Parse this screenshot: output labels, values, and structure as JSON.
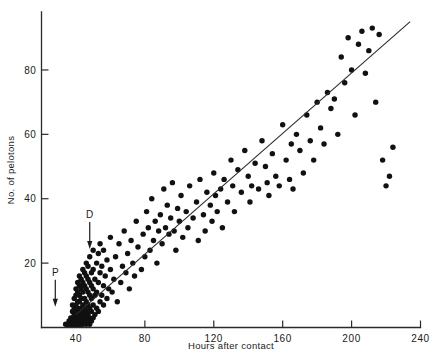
{
  "chart_data": {
    "type": "scatter",
    "title": "",
    "subtitle": "",
    "xlabel": "Hours after contact",
    "ylabel": "No. of pelotons",
    "xlim": [
      20,
      240
    ],
    "ylim": [
      0,
      98
    ],
    "grid": false,
    "legend": null,
    "x_ticks": [
      40,
      80,
      120,
      160,
      200,
      240
    ],
    "y_ticks": [
      20,
      40,
      60,
      80
    ],
    "x_tick_labels": [
      "40",
      "80",
      "120",
      "160",
      "200",
      "240"
    ],
    "y_tick_labels": [
      "20",
      "40",
      "60",
      "80"
    ],
    "annotations": [
      {
        "label": "P",
        "x": 28,
        "y": 12,
        "arrow": "down",
        "description": "arrow marking P event on time axis"
      },
      {
        "label": "D",
        "x": 48,
        "y": 30,
        "arrow": "down",
        "description": "arrow marking D event on time axis"
      }
    ],
    "series": [
      {
        "name": "pelotons",
        "marker": "filled-circle",
        "marker_color": "#111111",
        "marker_size": 4.2,
        "points": [
          [
            34,
            1
          ],
          [
            35,
            1
          ],
          [
            36,
            1
          ],
          [
            36,
            2
          ],
          [
            37,
            1
          ],
          [
            37,
            2
          ],
          [
            37,
            3
          ],
          [
            38,
            1
          ],
          [
            38,
            2
          ],
          [
            38,
            3
          ],
          [
            38,
            5
          ],
          [
            38,
            7
          ],
          [
            39,
            1
          ],
          [
            39,
            2
          ],
          [
            39,
            4
          ],
          [
            39,
            6
          ],
          [
            39,
            9
          ],
          [
            40,
            1
          ],
          [
            40,
            2
          ],
          [
            40,
            3
          ],
          [
            40,
            5
          ],
          [
            40,
            7
          ],
          [
            40,
            10
          ],
          [
            40,
            12
          ],
          [
            41,
            1
          ],
          [
            41,
            2
          ],
          [
            41,
            4
          ],
          [
            41,
            6
          ],
          [
            41,
            8
          ],
          [
            41,
            11
          ],
          [
            41,
            14
          ],
          [
            42,
            1
          ],
          [
            42,
            2
          ],
          [
            42,
            3
          ],
          [
            42,
            5
          ],
          [
            42,
            8
          ],
          [
            42,
            10
          ],
          [
            42,
            13
          ],
          [
            42,
            16
          ],
          [
            43,
            1
          ],
          [
            43,
            2
          ],
          [
            43,
            4
          ],
          [
            43,
            6
          ],
          [
            43,
            9
          ],
          [
            43,
            12
          ],
          [
            43,
            15
          ],
          [
            44,
            1
          ],
          [
            44,
            3
          ],
          [
            44,
            5
          ],
          [
            44,
            7
          ],
          [
            44,
            11
          ],
          [
            44,
            14
          ],
          [
            44,
            18
          ],
          [
            45,
            2
          ],
          [
            45,
            4
          ],
          [
            45,
            6
          ],
          [
            45,
            9
          ],
          [
            45,
            13
          ],
          [
            45,
            17
          ],
          [
            46,
            1
          ],
          [
            46,
            3
          ],
          [
            46,
            5
          ],
          [
            46,
            8
          ],
          [
            46,
            12
          ],
          [
            46,
            16
          ],
          [
            46,
            20
          ],
          [
            47,
            2
          ],
          [
            47,
            4
          ],
          [
            47,
            7
          ],
          [
            47,
            11
          ],
          [
            47,
            15
          ],
          [
            47,
            19
          ],
          [
            48,
            1
          ],
          [
            48,
            3
          ],
          [
            48,
            6
          ],
          [
            48,
            10
          ],
          [
            48,
            14
          ],
          [
            48,
            22
          ],
          [
            49,
            2
          ],
          [
            49,
            5
          ],
          [
            49,
            9
          ],
          [
            49,
            13
          ],
          [
            49,
            17
          ],
          [
            50,
            3
          ],
          [
            50,
            7
          ],
          [
            50,
            12
          ],
          [
            50,
            18
          ],
          [
            50,
            24
          ],
          [
            51,
            4
          ],
          [
            51,
            10
          ],
          [
            51,
            15
          ],
          [
            52,
            6
          ],
          [
            52,
            11
          ],
          [
            52,
            20
          ],
          [
            53,
            5
          ],
          [
            53,
            14
          ],
          [
            53,
            23
          ],
          [
            54,
            8
          ],
          [
            54,
            17
          ],
          [
            54,
            26
          ],
          [
            55,
            10
          ],
          [
            55,
            19
          ],
          [
            56,
            7
          ],
          [
            56,
            13
          ],
          [
            56,
            24
          ],
          [
            57,
            16
          ],
          [
            58,
            9
          ],
          [
            58,
            21
          ],
          [
            59,
            12
          ],
          [
            60,
            18
          ],
          [
            60,
            28
          ],
          [
            61,
            11
          ],
          [
            62,
            15
          ],
          [
            63,
            22
          ],
          [
            64,
            8
          ],
          [
            65,
            26
          ],
          [
            66,
            14
          ],
          [
            67,
            19
          ],
          [
            68,
            30
          ],
          [
            69,
            17
          ],
          [
            70,
            23
          ],
          [
            71,
            12
          ],
          [
            72,
            27
          ],
          [
            73,
            20
          ],
          [
            74,
            16
          ],
          [
            75,
            33
          ],
          [
            76,
            25
          ],
          [
            78,
            18
          ],
          [
            79,
            29
          ],
          [
            80,
            22
          ],
          [
            81,
            36
          ],
          [
            82,
            31
          ],
          [
            83,
            24
          ],
          [
            84,
            40
          ],
          [
            85,
            27
          ],
          [
            86,
            33
          ],
          [
            87,
            20
          ],
          [
            88,
            30
          ],
          [
            89,
            35
          ],
          [
            90,
            26
          ],
          [
            91,
            43
          ],
          [
            92,
            31
          ],
          [
            93,
            38
          ],
          [
            94,
            29
          ],
          [
            95,
            34
          ],
          [
            96,
            45
          ],
          [
            97,
            30
          ],
          [
            98,
            24
          ],
          [
            99,
            37
          ],
          [
            100,
            33
          ],
          [
            101,
            41
          ],
          [
            102,
            28
          ],
          [
            104,
            36
          ],
          [
            105,
            31
          ],
          [
            106,
            44
          ],
          [
            108,
            34
          ],
          [
            110,
            39
          ],
          [
            111,
            27
          ],
          [
            112,
            46
          ],
          [
            114,
            35
          ],
          [
            115,
            30
          ],
          [
            116,
            42
          ],
          [
            118,
            38
          ],
          [
            119,
            33
          ],
          [
            120,
            48
          ],
          [
            121,
            41
          ],
          [
            122,
            36
          ],
          [
            124,
            43
          ],
          [
            125,
            31
          ],
          [
            126,
            46
          ],
          [
            128,
            39
          ],
          [
            130,
            52
          ],
          [
            131,
            44
          ],
          [
            132,
            36
          ],
          [
            134,
            49
          ],
          [
            136,
            42
          ],
          [
            138,
            55
          ],
          [
            140,
            47
          ],
          [
            141,
            39
          ],
          [
            142,
            44
          ],
          [
            144,
            51
          ],
          [
            146,
            43
          ],
          [
            148,
            58
          ],
          [
            150,
            50
          ],
          [
            151,
            45
          ],
          [
            152,
            41
          ],
          [
            154,
            54
          ],
          [
            156,
            47
          ],
          [
            158,
            44
          ],
          [
            160,
            63
          ],
          [
            162,
            52
          ],
          [
            164,
            46
          ],
          [
            165,
            57
          ],
          [
            166,
            43
          ],
          [
            168,
            60
          ],
          [
            170,
            55
          ],
          [
            172,
            48
          ],
          [
            174,
            66
          ],
          [
            176,
            58
          ],
          [
            178,
            52
          ],
          [
            180,
            70
          ],
          [
            182,
            62
          ],
          [
            184,
            57
          ],
          [
            186,
            73
          ],
          [
            188,
            68
          ],
          [
            190,
            71
          ],
          [
            192,
            60
          ],
          [
            194,
            84
          ],
          [
            196,
            76
          ],
          [
            198,
            90
          ],
          [
            200,
            80
          ],
          [
            202,
            66
          ],
          [
            204,
            88
          ],
          [
            206,
            92
          ],
          [
            208,
            79
          ],
          [
            210,
            86
          ],
          [
            212,
            93
          ],
          [
            214,
            70
          ],
          [
            216,
            91
          ],
          [
            218,
            52
          ],
          [
            220,
            44
          ],
          [
            222,
            47
          ],
          [
            224,
            56
          ]
        ]
      }
    ],
    "fit_line": {
      "type": "linear-regression",
      "x_start": 40,
      "y_start": 4,
      "x_end": 234,
      "y_end": 95
    }
  }
}
